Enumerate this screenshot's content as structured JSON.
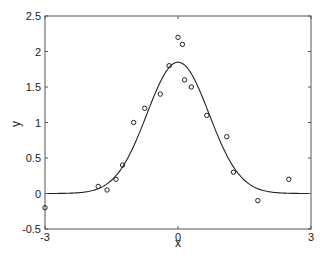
{
  "chart_data": {
    "type": "scatter",
    "title": "",
    "xlabel": "x",
    "ylabel": "y",
    "xlim": [
      -3,
      3
    ],
    "ylim": [
      -0.5,
      2.5
    ],
    "xticks": [
      "-3",
      "0",
      "3"
    ],
    "xtick_values": [
      -3,
      0,
      3
    ],
    "yticks": [
      "-0.5",
      "0",
      "0.5",
      "1",
      "1.5",
      "2",
      "2.5"
    ],
    "ytick_values": [
      -0.5,
      0,
      0.5,
      1,
      1.5,
      2,
      2.5
    ],
    "grid": false,
    "legend": null,
    "series": [
      {
        "name": "data",
        "type": "scatter",
        "marker": "circle-open",
        "x": [
          -3.0,
          -1.8,
          -1.6,
          -1.4,
          -1.25,
          -1.0,
          -0.75,
          -0.4,
          -0.2,
          0.0,
          0.1,
          0.15,
          0.3,
          0.65,
          1.1,
          1.25,
          1.8,
          2.5
        ],
        "y": [
          -0.2,
          0.1,
          0.05,
          0.2,
          0.4,
          1.0,
          1.2,
          1.4,
          1.8,
          2.2,
          2.1,
          1.6,
          1.5,
          1.1,
          0.8,
          0.3,
          -0.1,
          0.2
        ]
      },
      {
        "name": "fit",
        "type": "line",
        "function": "gaussian",
        "amplitude": 1.85,
        "mean": 0.0,
        "sigma": 0.7
      }
    ]
  }
}
